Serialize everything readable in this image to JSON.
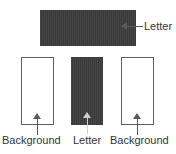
{
  "figure": {
    "title": "",
    "top_callout": {
      "arrow": "arrow-left-icon",
      "label": "Letter"
    },
    "panels": [
      {
        "id": "panel-background-left",
        "role": "background",
        "fill": "#ffffff",
        "border": "#5e5e5e",
        "arrow": "arrow-up-icon",
        "arrow_color": "#5a5a5a",
        "label": "Background"
      },
      {
        "id": "panel-letter-middle",
        "role": "letter",
        "fill": "#3a3a3a",
        "border": "none",
        "arrow": "arrow-up-icon",
        "arrow_color": "#cfcfcf",
        "label": "Letter"
      },
      {
        "id": "panel-background-right",
        "role": "background",
        "fill": "#ffffff",
        "border": "#5e5e5e",
        "arrow": "arrow-up-icon",
        "arrow_color": "#5a5a5a",
        "label": "Background"
      }
    ],
    "letter_band": {
      "id": "letter-band",
      "fill": "#3a3a3a",
      "label": "Letter"
    },
    "colors": {
      "letter_fill": "#3a3a3a",
      "background_fill": "#ffffff",
      "stroke": "#5e5e5e",
      "text": "#333333",
      "light_arrow": "#cfcfcf"
    }
  }
}
